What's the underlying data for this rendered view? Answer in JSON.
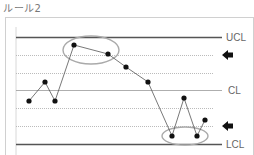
{
  "title": "ルール2",
  "chart_data": {
    "type": "line",
    "title": "ルール2",
    "xlabel": "",
    "ylabel": "",
    "grid": true,
    "control_lines": [
      {
        "name": "UCL",
        "label": "UCL",
        "y": 37,
        "style": "solid",
        "color": "#555555"
      },
      {
        "name": "upper-zone-1",
        "label": "",
        "y": 55,
        "style": "dotted",
        "color": "#bbbbbb"
      },
      {
        "name": "upper-zone-2",
        "label": "",
        "y": 73,
        "style": "dotted",
        "color": "#bbbbbb"
      },
      {
        "name": "CL",
        "label": "CL",
        "y": 90,
        "style": "solid",
        "color": "#999999"
      },
      {
        "name": "lower-zone-1",
        "label": "",
        "y": 108,
        "style": "dotted",
        "color": "#bbbbbb"
      },
      {
        "name": "lower-zone-2",
        "label": "",
        "y": 126,
        "style": "dotted",
        "color": "#bbbbbb"
      },
      {
        "name": "LCL",
        "label": "LCL",
        "y": 144,
        "style": "solid",
        "color": "#555555"
      }
    ],
    "labels": [
      "UCL",
      "CL",
      "LCL"
    ],
    "points": [
      {
        "x": 29,
        "y": 101
      },
      {
        "x": 45,
        "y": 82
      },
      {
        "x": 55,
        "y": 101
      },
      {
        "x": 74,
        "y": 45
      },
      {
        "x": 108,
        "y": 54
      },
      {
        "x": 126,
        "y": 67
      },
      {
        "x": 148,
        "y": 82
      },
      {
        "x": 172,
        "y": 136
      },
      {
        "x": 184,
        "y": 98
      },
      {
        "x": 197,
        "y": 136
      },
      {
        "x": 205,
        "y": 120
      }
    ],
    "highlights": [
      {
        "name": "upper-highlight",
        "cx": 91,
        "cy": 50,
        "rx": 28,
        "ry": 14,
        "note": "2 of 3 points beyond 2σ (upper)"
      },
      {
        "name": "lower-highlight",
        "cx": 185,
        "cy": 136,
        "rx": 23,
        "ry": 9,
        "note": "2 of 3 points beyond 2σ (lower)"
      }
    ],
    "arrows": [
      {
        "name": "upper-arrow",
        "y": 55,
        "direction": "left"
      },
      {
        "name": "lower-arrow",
        "y": 126,
        "direction": "left"
      }
    ],
    "colors": {
      "point": "#111111",
      "line": "#555555",
      "ellipse": "#aaaaaa",
      "arrow": "#111111",
      "frame": "#cccccc"
    }
  }
}
